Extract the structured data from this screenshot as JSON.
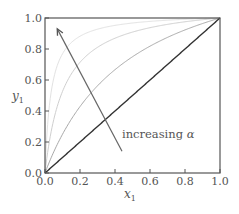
{
  "chart_data": {
    "type": "line",
    "title": "",
    "xlabel": "x",
    "xlabel_sub": "1",
    "ylabel": "y",
    "ylabel_sub": "1",
    "xlim": [
      0.0,
      1.0
    ],
    "ylim": [
      0.0,
      1.0
    ],
    "xticks": [
      "0.0",
      "0.2",
      "0.4",
      "0.6",
      "0.8",
      "1.0"
    ],
    "yticks": [
      "0.0",
      "0.2",
      "0.4",
      "0.6",
      "0.8",
      "1.0"
    ],
    "grid": false,
    "legend": null,
    "formula": "y1 = alpha*x1 / (1 + (alpha - 1)*x1)",
    "series": [
      {
        "name": "alpha=1 (diagonal)",
        "alpha": 1,
        "color": "#333333",
        "width": 1.4
      },
      {
        "name": "alpha~3",
        "alpha": 3,
        "color": "#a8a8a8",
        "width": 1.0
      },
      {
        "name": "alpha~10",
        "alpha": 10,
        "color": "#cfcfcf",
        "width": 1.0
      },
      {
        "name": "alpha~30",
        "alpha": 30,
        "color": "#e2e2e2",
        "width": 1.0
      }
    ],
    "sample_points": {
      "x": [
        0.0,
        0.2,
        0.5,
        1.0
      ],
      "alpha_1": [
        0.0,
        0.2,
        0.5,
        1.0
      ],
      "alpha_3": [
        0.0,
        0.43,
        0.75,
        1.0
      ],
      "alpha_10": [
        0.0,
        0.71,
        0.91,
        1.0
      ],
      "alpha_30": [
        0.0,
        0.88,
        0.97,
        1.0
      ]
    },
    "annotations": [
      {
        "text": "increasing",
        "symbol": "α",
        "x": 0.44,
        "y": 0.25,
        "arrow_from": [
          0.44,
          0.14
        ],
        "arrow_to": [
          0.07,
          0.93
        ]
      }
    ]
  },
  "labels": {
    "annotation_text": "increasing ",
    "annotation_symbol": "α"
  }
}
